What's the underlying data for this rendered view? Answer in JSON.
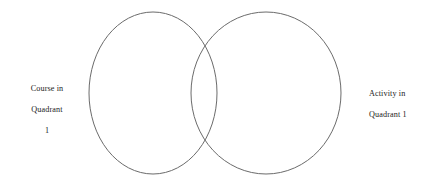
{
  "diagram": {
    "type": "venn-two-set",
    "title": "",
    "background_color": "#ffffff",
    "stroke_color": "#6b6b6b",
    "text_color": "#1c1c1c"
  },
  "labels": {
    "left": {
      "name": "course-in-quadrant-1",
      "lines": [
        "Course in",
        "Quadrant",
        "1"
      ],
      "full_text": "Course in Quadrant 1",
      "align": "center"
    },
    "right": {
      "name": "activity-in-quadrant-1",
      "lines": [
        "Activity in",
        "Quadrant 1"
      ],
      "full_text": "Activity in Quadrant 1",
      "align": "left"
    }
  },
  "sets": [
    {
      "id": "left-set",
      "label": "Course in Quadrant 1",
      "cx": 153,
      "cy": 93,
      "rx": 64,
      "ry": 81
    },
    {
      "id": "right-set",
      "label": "Activity in Quadrant 1",
      "cx": 266,
      "cy": 93,
      "rx": 75,
      "ry": 81
    }
  ],
  "regions": {
    "left_only": "",
    "intersection": "",
    "right_only": ""
  }
}
